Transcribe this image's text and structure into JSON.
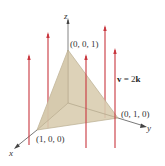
{
  "figure": {
    "axes": {
      "x_label": "x",
      "y_label": "y",
      "z_label": "z"
    },
    "vertices": {
      "x_point": "(1, 0, 0)",
      "y_point": "(0, 1, 0)",
      "z_point": "(0, 0, 1)"
    },
    "field_label_v": "v",
    "field_label_eq": " = 2",
    "field_label_k": "k",
    "colors": {
      "arrow": "#c8363e",
      "surface_fill": "#d9cdb0",
      "surface_edge": "#b9ad90",
      "axis": "#555555",
      "background": "#ffffff"
    }
  }
}
